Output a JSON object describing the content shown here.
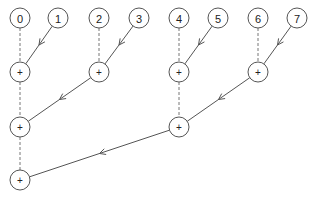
{
  "diagram": {
    "type": "parallel-reduction-tree",
    "inputs": [
      {
        "id": "n0",
        "label": "0",
        "x": 20,
        "y": 18
      },
      {
        "id": "n1",
        "label": "1",
        "x": 58,
        "y": 18
      },
      {
        "id": "n2",
        "label": "2",
        "x": 99,
        "y": 18
      },
      {
        "id": "n3",
        "label": "3",
        "x": 139,
        "y": 18
      },
      {
        "id": "n4",
        "label": "4",
        "x": 179,
        "y": 18
      },
      {
        "id": "n5",
        "label": "5",
        "x": 218,
        "y": 18
      },
      {
        "id": "n6",
        "label": "6",
        "x": 258,
        "y": 18
      },
      {
        "id": "n7",
        "label": "7",
        "x": 297,
        "y": 18
      }
    ],
    "operators": [
      {
        "id": "a0",
        "label": "+",
        "x": 20,
        "y": 72
      },
      {
        "id": "a1",
        "label": "+",
        "x": 99,
        "y": 72
      },
      {
        "id": "a2",
        "label": "+",
        "x": 179,
        "y": 72
      },
      {
        "id": "a3",
        "label": "+",
        "x": 258,
        "y": 72
      },
      {
        "id": "b0",
        "label": "+",
        "x": 20,
        "y": 127
      },
      {
        "id": "b1",
        "label": "+",
        "x": 179,
        "y": 127
      },
      {
        "id": "c0",
        "label": "+",
        "x": 20,
        "y": 180
      }
    ],
    "dashed_edges": [
      [
        "n0",
        "a0"
      ],
      [
        "n2",
        "a1"
      ],
      [
        "n4",
        "a2"
      ],
      [
        "n6",
        "a3"
      ],
      [
        "a0",
        "b0"
      ],
      [
        "a2",
        "b1"
      ],
      [
        "b0",
        "c0"
      ]
    ],
    "arrow_edges": [
      [
        "n1",
        "a0"
      ],
      [
        "n3",
        "a1"
      ],
      [
        "n5",
        "a2"
      ],
      [
        "n7",
        "a3"
      ],
      [
        "a1",
        "b0"
      ],
      [
        "a3",
        "b1"
      ],
      [
        "b1",
        "c0"
      ]
    ]
  }
}
